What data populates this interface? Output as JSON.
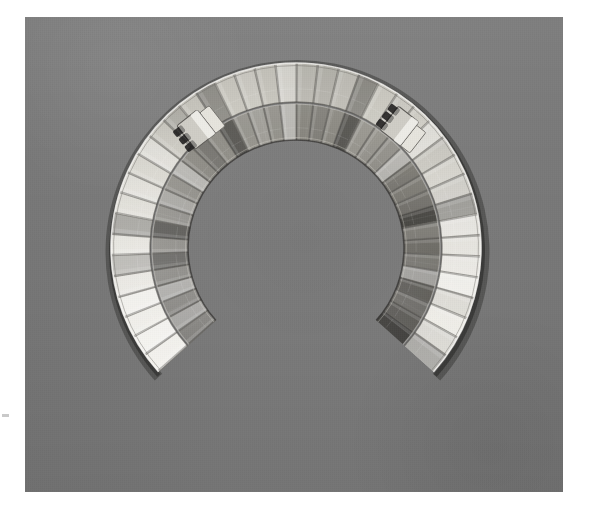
{
  "page": {
    "title": "Metal Collar Necklace — Photograph",
    "canvas_width": 595,
    "canvas_height": 519,
    "page_background": "#ffffff",
    "margin_note": "white paper margin surrounding a single photographic plate"
  },
  "photo": {
    "name": "museum-object-photograph",
    "caption": "Crescent-shaped segmented metal collar necklace lying flat on a gray cloth backdrop",
    "x": 25,
    "y": 17,
    "width": 538,
    "height": 475,
    "backdrop_color": "#7a7a7a",
    "backdrop_shade_top": "#818181",
    "backdrop_shade_bottom": "#6e6e6e",
    "lighting": "soft diffuse from upper left"
  },
  "object": {
    "name": "segmented-collar-necklace",
    "form": "open C / crescent, opening toward the top",
    "material": "polished white metal (silver)",
    "center_x": 296,
    "center_y": 248,
    "outer_radius": 185,
    "inner_radius": 108,
    "gap_direction": "up",
    "gap_degrees": 96,
    "band_count": 2,
    "bands": [
      {
        "name": "outer-plate-band",
        "plate_count": 40,
        "inner_radius": 146,
        "outer_radius": 185,
        "tone": "bright highly reflective, pale highlights",
        "highlight_color": "#efeeea",
        "shadow_color": "#8f8d86"
      },
      {
        "name": "inner-plate-band",
        "plate_count": 40,
        "inner_radius": 108,
        "outer_radius": 144,
        "tone": "darker, strong specular band near bottom centre",
        "highlight_color": "#d8d6cf",
        "shadow_color": "#4d4b47"
      }
    ],
    "plate_shape": "radial trapezoid, wider at the outer edge",
    "drop_shadow": "thin dark line hugging the lower outer rim"
  },
  "terminals": [
    {
      "name": "left-terminal-clasp",
      "side": "left",
      "x": 196,
      "y": 131,
      "angle_degrees": 232,
      "description": "hinged end fitting with small dark link elements"
    },
    {
      "name": "right-terminal-clasp",
      "side": "right",
      "x": 398,
      "y": 126,
      "angle_degrees": 308,
      "description": "hinged end fitting with a flat tongue plate and dark links"
    }
  ],
  "colors": {
    "paper_white": "#ffffff",
    "backdrop_gray": "#7a7a7a",
    "metal_highlight": "#f3f2ee",
    "metal_midtone": "#bfbdb6",
    "metal_shadow": "#55534f",
    "seam_line": "#6a6863",
    "cast_shadow": "#3a3a38",
    "margin_tick": "#c9c9c9"
  },
  "marks": {
    "left_margin_tick": {
      "name": "margin-registration-tick",
      "x": 2,
      "y": 414,
      "width": 7,
      "height": 3
    }
  }
}
